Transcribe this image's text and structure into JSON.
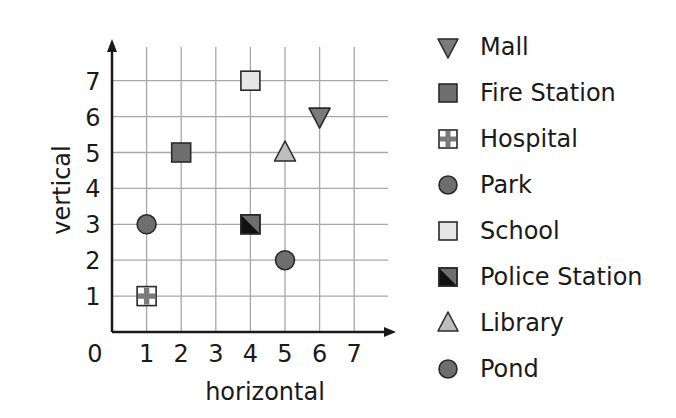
{
  "chart_data": {
    "type": "scatter",
    "title": "",
    "xlabel": "horizontal",
    "ylabel": "vertical",
    "xlim": [
      0,
      7
    ],
    "ylim": [
      0,
      7
    ],
    "x_ticks": [
      "0",
      "1",
      "2",
      "3",
      "4",
      "5",
      "6",
      "7"
    ],
    "y_ticks": [
      "1",
      "2",
      "3",
      "4",
      "5",
      "6",
      "7"
    ],
    "grid": true,
    "legend_position": "right",
    "points": [
      {
        "name": "Mall",
        "x": 6,
        "y": 6,
        "marker": "triangle-down",
        "color": "#7a7a7a"
      },
      {
        "name": "Fire Station",
        "x": 2,
        "y": 5,
        "marker": "square",
        "color": "#6e6e6e"
      },
      {
        "name": "Hospital",
        "x": 1,
        "y": 1,
        "marker": "square-cross",
        "color": "#ffffff"
      },
      {
        "name": "Park",
        "x": 1,
        "y": 3,
        "marker": "circle",
        "color": "#6e6e6e"
      },
      {
        "name": "School",
        "x": 4,
        "y": 7,
        "marker": "square",
        "color": "#e6e6e6"
      },
      {
        "name": "Police Station",
        "x": 4,
        "y": 3,
        "marker": "square-half",
        "color": "#111111"
      },
      {
        "name": "Library",
        "x": 5,
        "y": 5,
        "marker": "triangle-up",
        "color": "#bdbdbd"
      },
      {
        "name": "Pond",
        "x": 5,
        "y": 2,
        "marker": "circle",
        "color": "#6e6e6e"
      }
    ]
  },
  "legend": {
    "items": [
      {
        "label": "Mall",
        "icon": "triangle-down-icon"
      },
      {
        "label": "Fire Station",
        "icon": "square-icon"
      },
      {
        "label": "Hospital",
        "icon": "hospital-cross-icon"
      },
      {
        "label": "Park",
        "icon": "circle-icon"
      },
      {
        "label": "School",
        "icon": "light-square-icon"
      },
      {
        "label": "Police Station",
        "icon": "half-square-icon"
      },
      {
        "label": "Library",
        "icon": "triangle-up-icon"
      },
      {
        "label": "Pond",
        "icon": "circle-icon"
      }
    ]
  },
  "colors": {
    "grid": "#a8a8a8",
    "axis": "#1a1a1a",
    "marker_dark": "#6e6e6e",
    "marker_light": "#e6e6e6",
    "marker_mid": "#bdbdbd",
    "marker_black": "#111111"
  }
}
